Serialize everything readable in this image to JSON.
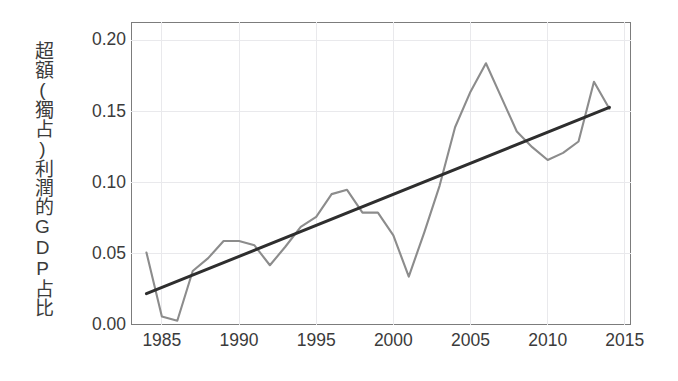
{
  "chart_data": {
    "type": "line",
    "title": "",
    "subtitle": "",
    "xlabel": "",
    "ylabel": "超額(獨占)利潤的GDP占比",
    "ylabel_vertical_text": "超額(獨占)利潤的GDP占比",
    "xlim": [
      1983.0,
      2015.4
    ],
    "ylim": [
      0.0,
      0.213
    ],
    "x_ticks": [
      1985,
      1990,
      1995,
      2000,
      2005,
      2010,
      2015
    ],
    "x_tick_labels": [
      "1985",
      "1990",
      "1995",
      "2000",
      "2005",
      "2010",
      "2015"
    ],
    "y_ticks": [
      0.0,
      0.05,
      0.1,
      0.15,
      0.2
    ],
    "y_tick_labels": [
      "0.00",
      "0.05",
      "0.10",
      "0.15",
      "0.20"
    ],
    "grid": true,
    "grid_color": "#e9e9ec",
    "legend": "none",
    "background_color": "#ffffff",
    "frame_color": "#7c7c7c",
    "series": [
      {
        "name": "超額(獨占)利潤的GDP占比",
        "kind": "line",
        "color": "#8c8c8c",
        "x": [
          1984,
          1985,
          1986,
          1987,
          1988,
          1989,
          1990,
          1991,
          1992,
          1993,
          1994,
          1995,
          1996,
          1997,
          1998,
          1999,
          2000,
          2001,
          2002,
          2003,
          2004,
          2005,
          2006,
          2007,
          2008,
          2009,
          2010,
          2011,
          2012,
          2013,
          2014
        ],
        "values": [
          0.051,
          0.006,
          0.003,
          0.038,
          0.047,
          0.059,
          0.059,
          0.056,
          0.042,
          0.055,
          0.069,
          0.076,
          0.092,
          0.095,
          0.079,
          0.079,
          0.063,
          0.034,
          0.065,
          0.098,
          0.139,
          0.164,
          0.184,
          0.16,
          0.136,
          0.125,
          0.116,
          0.121,
          0.129,
          0.171,
          0.152
        ]
      },
      {
        "name": "線性趨勢線",
        "kind": "trendline",
        "color": "#2e2e2e",
        "x": [
          1984,
          2014
        ],
        "values": [
          0.022,
          0.153
        ]
      }
    ]
  },
  "axis": {
    "y_title": "超額(獨占)利潤的GDP占比"
  },
  "colors": {
    "series": "#8c8c8c",
    "trend": "#2e2e2e",
    "grid": "#e9e9ec",
    "frame": "#7c7c7c",
    "text": "#3b3b3b",
    "background": "#ffffff"
  }
}
